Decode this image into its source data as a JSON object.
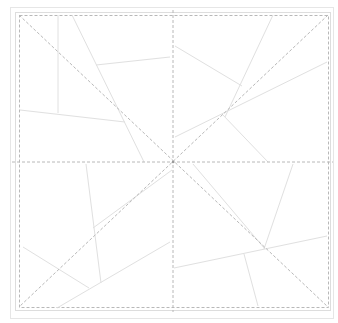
{
  "diagram": {
    "type": "crease-pattern",
    "width": 338,
    "height": 323,
    "colors": {
      "background": "#ffffff",
      "outer_frame": "#e6e6e6",
      "inner_frame": "#dddddd",
      "dashed": "#b8b8b8",
      "solid": "#e0e0e0"
    },
    "outer_frame": {
      "x": 10,
      "y": 7,
      "w": 323,
      "h": 311
    },
    "inner_frame": {
      "x": 15,
      "y": 12,
      "w": 315,
      "h": 298
    },
    "dashed_square": {
      "x": 19,
      "y": 15,
      "w": 309,
      "h": 292
    },
    "center": [
      173,
      162
    ],
    "dashed_lines": [
      [
        19,
        15,
        328,
        307
      ],
      [
        328,
        15,
        19,
        307
      ],
      [
        12,
        162,
        333,
        162
      ],
      [
        173,
        10,
        173,
        312
      ]
    ],
    "solid_lines": [
      [
        58,
        15,
        58,
        113
      ],
      [
        72,
        15,
        144,
        162
      ],
      [
        96,
        65,
        170,
        57
      ],
      [
        20,
        110,
        125,
        122
      ],
      [
        273,
        15,
        225,
        117
      ],
      [
        175,
        46,
        242,
        86
      ],
      [
        327,
        62,
        175,
        137
      ],
      [
        222,
        114,
        268,
        162
      ],
      [
        86,
        164,
        101,
        283
      ],
      [
        93,
        228,
        172,
        170
      ],
      [
        23,
        247,
        89,
        288
      ],
      [
        57,
        308,
        170,
        242
      ],
      [
        193,
        164,
        265,
        249
      ],
      [
        293,
        164,
        264,
        249
      ],
      [
        174,
        268,
        327,
        236
      ],
      [
        244,
        254,
        258,
        306
      ]
    ]
  }
}
